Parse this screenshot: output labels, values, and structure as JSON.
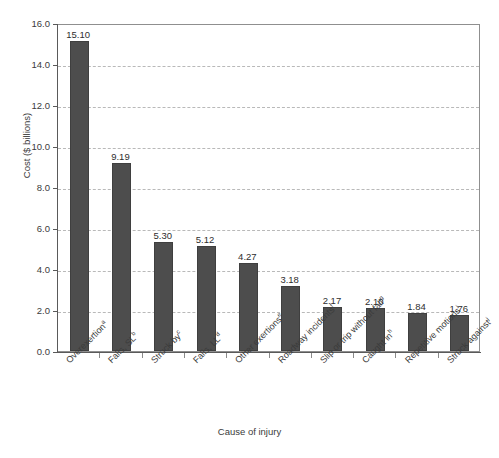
{
  "figure": {
    "top_caption_fragment": "",
    "x_axis_title": "Cause of injury",
    "y_axis_title": "Cost ($ billions)"
  },
  "colors": {
    "bar_fill": "#4d4d4d",
    "bar_edge": "#3f3f3f",
    "gridline": "#b9b9b9",
    "axis": "#5a5a5a",
    "frame": "#8f8f8f",
    "text": "#3b3b3b"
  },
  "chart_data": {
    "type": "bar",
    "title": "",
    "xlabel": "Cause of injury",
    "ylabel": "Cost ($ billions)",
    "ylim": [
      0.0,
      16.0
    ],
    "ytick_labels": [
      "16.0",
      "14.0",
      "12.0",
      "10.0",
      "8.0",
      "6.0",
      "4.0",
      "2.0",
      "0.0"
    ],
    "ytick_values": [
      16.0,
      14.0,
      12.0,
      10.0,
      8.0,
      6.0,
      4.0,
      2.0,
      0.0
    ],
    "grid": true,
    "grid_axis": "y",
    "grid_style": "dashed",
    "legend": "none",
    "categories": [
      "Overexertion",
      "Falls, SL",
      "Struck by",
      "Falls, LL",
      "Other exertions",
      "Roadway incidents",
      "Slip or trip without fall",
      "Caught in",
      "Repetitive motions",
      "Struck against"
    ],
    "category_footnotes": [
      "a",
      "b",
      "c",
      "d",
      "e",
      "f",
      "g",
      "h",
      "i",
      "j"
    ],
    "values": [
      15.1,
      9.19,
      5.3,
      5.12,
      4.27,
      3.18,
      2.17,
      2.1,
      1.84,
      1.76
    ],
    "value_labels": [
      "15.10",
      "9.19",
      "5.30",
      "5.12",
      "4.27",
      "3.18",
      "2.17",
      "2.10",
      "1.84",
      "1.76"
    ]
  }
}
